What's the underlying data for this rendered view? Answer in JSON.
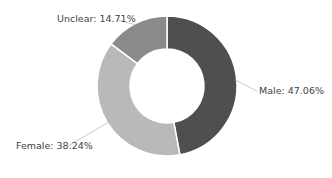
{
  "chart_data": {
    "type": "pie",
    "subtype": "donut",
    "title": "",
    "categories": [
      "Male",
      "Female",
      "Unclear"
    ],
    "values": [
      47.06,
      38.24,
      14.71
    ],
    "colors": [
      "#4f4f4f",
      "#b9b9b9",
      "#8a8a8a"
    ],
    "labels": [
      "Male: 47.06%",
      "Female: 38.24%",
      "Unclear: 14.71%"
    ],
    "legend": "none",
    "start_angle": "12 o'clock, clockwise"
  }
}
